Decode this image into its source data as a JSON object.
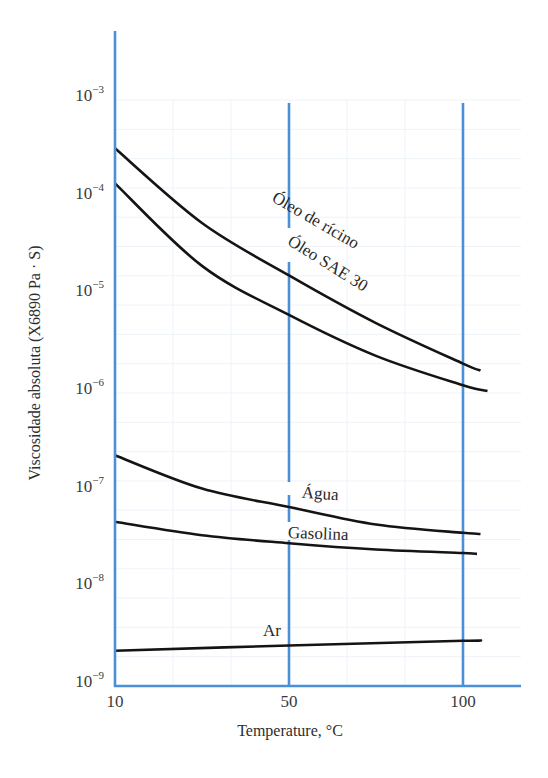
{
  "chart_data": {
    "type": "line",
    "title": "",
    "xlabel": "Temperature, °C",
    "ylabel": "Viscosidade absoluta (X6890 Pa · S)",
    "yscale": "log",
    "ylim": [
      1e-09,
      0.001
    ],
    "xlim": [
      10,
      110
    ],
    "x_ticks": [
      10,
      50,
      100
    ],
    "x_tick_labels": [
      "10",
      "50",
      "100"
    ],
    "y_ticks": [
      1e-09,
      1e-08,
      1e-07,
      1e-06,
      1e-05,
      0.0001,
      0.001
    ],
    "y_tick_labels": [
      {
        "base": "10",
        "exp": "−9"
      },
      {
        "base": "10",
        "exp": "−8"
      },
      {
        "base": "10",
        "exp": "−7"
      },
      {
        "base": "10",
        "exp": "−6"
      },
      {
        "base": "10",
        "exp": "−5"
      },
      {
        "base": "10",
        "exp": "−4"
      },
      {
        "base": "10",
        "exp": "−3"
      }
    ],
    "grid": true,
    "legend": "none (inline curve labels)",
    "series": [
      {
        "name": "Óleo de rícino",
        "x": [
          10,
          30,
          50,
          75,
          100,
          105
        ],
        "y": [
          0.00032,
          5.5e-05,
          1.6e-05,
          5.2e-06,
          2e-06,
          1.7e-06
        ],
        "label_pos": {
          "x": 313,
          "y": 225,
          "rotate": 30
        }
      },
      {
        "name": "Óleo SAE 30",
        "x": [
          10,
          30,
          50,
          75,
          100,
          107
        ],
        "y": [
          0.00014,
          2e-05,
          6.3e-06,
          2.4e-06,
          1.2e-06,
          1.05e-06
        ],
        "label_pos": {
          "x": 325,
          "y": 268,
          "rotate": 32
        }
      },
      {
        "name": "Água",
        "x": [
          10,
          30,
          50,
          75,
          100,
          105
        ],
        "y": [
          2.3e-07,
          1.05e-07,
          6.8e-08,
          4.5e-08,
          3.7e-08,
          3.6e-08
        ],
        "label_pos": {
          "x": 320,
          "y": 499,
          "rotate": 4
        }
      },
      {
        "name": "Gasolina",
        "x": [
          10,
          30,
          50,
          75,
          100,
          104
        ],
        "y": [
          4.8e-08,
          3.5e-08,
          2.9e-08,
          2.5e-08,
          2.3e-08,
          2.25e-08
        ],
        "label_pos": {
          "x": 318,
          "y": 539,
          "rotate": 2
        }
      },
      {
        "name": "Ar",
        "x": [
          10,
          50,
          100,
          104
        ],
        "y": [
          2.3e-09,
          2.6e-09,
          2.9e-09,
          2.9e-09
        ],
        "label_pos": {
          "x": 272,
          "y": 636,
          "rotate": 0
        }
      }
    ]
  },
  "axis_colors": {
    "axis": "#4a90d9",
    "curve": "#141414",
    "grid": "#eef3f9"
  }
}
